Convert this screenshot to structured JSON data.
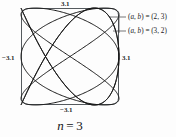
{
  "figure": {
    "caption_variable": "n",
    "caption_equals": "=",
    "caption_value": "3",
    "caption_full": "n = 3"
  },
  "axes": {
    "top_label": "3.1",
    "bottom_label": "−3.1",
    "left_label": "−3.1",
    "right_label": "3.1",
    "frame_color": "#555a5e"
  },
  "annotations": [
    {
      "label": "(a, b) = (2, 3)",
      "prefix": "(",
      "var_a": "a",
      "comma": ", ",
      "var_b": "b",
      "suffix": ") = (2, 3)"
    },
    {
      "label": "(a, b) = (3, 2)",
      "prefix": "(",
      "var_a": "a",
      "comma": ", ",
      "var_b": "b",
      "suffix": ") = (3, 2)"
    }
  ],
  "chart_data": {
    "type": "line",
    "subtitle": "",
    "xlabel": "",
    "ylabel": "",
    "xlim": [
      -3.1,
      3.1
    ],
    "ylim": [
      -3.1,
      3.1
    ],
    "xticks": [
      -3.1,
      3.1
    ],
    "yticks": [
      -3.1,
      3.1
    ],
    "xtick_labels": [
      "−3.1",
      "3.1"
    ],
    "ytick_labels": [
      "−3.1",
      "3.1"
    ],
    "grid": false,
    "legend_position": "right-outside",
    "series": [
      {
        "name": "(a, b) = (2, 3)",
        "type": "lissajous",
        "a": 2,
        "b": 3,
        "amplitude": 3.1,
        "color": "#161616"
      },
      {
        "name": "(a, b) = (3, 2)",
        "type": "lissajous",
        "a": 3,
        "b": 2,
        "amplitude": 3.1,
        "color": "#161616"
      }
    ]
  }
}
